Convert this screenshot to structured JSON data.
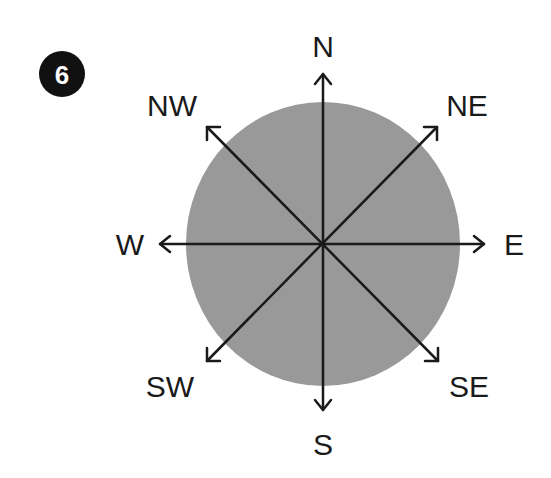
{
  "badge": {
    "number": "6",
    "bg_color": "#111111",
    "text_color": "#ffffff"
  },
  "compass": {
    "disc_color": "#999999",
    "line_color": "#1a1a1a",
    "directions": {
      "N": "N",
      "NE": "NE",
      "E": "E",
      "SE": "SE",
      "S": "S",
      "SW": "SW",
      "W": "W",
      "NW": "NW"
    }
  }
}
